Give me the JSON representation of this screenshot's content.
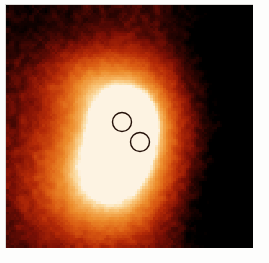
{
  "figure": {
    "title": "",
    "kind": "false-colour intensity map",
    "border_color": "#fcfcfb",
    "plate": {
      "x": 6,
      "y": 5,
      "width": 247,
      "height": 243
    }
  },
  "chart_data": {
    "type": "heatmap",
    "title": "",
    "subtitle": "",
    "xlabel": "",
    "ylabel": "",
    "grid": false,
    "legend": "none",
    "colorbar_shown": false,
    "colormap_name": "heat",
    "colormap_stops": [
      {
        "position": 0.0,
        "color": "#000000",
        "label": "lowest"
      },
      {
        "position": 0.18,
        "color": "#3a0603",
        "label": "very low"
      },
      {
        "position": 0.34,
        "color": "#7e1005",
        "label": "low"
      },
      {
        "position": 0.5,
        "color": "#b52a07",
        "label": "mid-low"
      },
      {
        "position": 0.66,
        "color": "#da5a12",
        "label": "mid"
      },
      {
        "position": 0.8,
        "color": "#ec8a2a",
        "label": "mid-high"
      },
      {
        "position": 0.9,
        "color": "#f6b661",
        "label": "high"
      },
      {
        "position": 0.97,
        "color": "#fbdfaa",
        "label": "very high"
      },
      {
        "position": 1.0,
        "color": "#fdf3e2",
        "label": "peak"
      }
    ],
    "value_range": [
      0,
      1
    ],
    "nx": 96,
    "ny": 94,
    "noise_amplitude": 0.17,
    "background_level": 0.06,
    "sources": [
      {
        "name": "extended halo",
        "cx": 0.475,
        "cy": 0.545,
        "amplitude": 0.62,
        "sigma_x": 0.3,
        "sigma_y": 0.4,
        "rotation_deg": -8
      },
      {
        "name": "inner envelope",
        "cx": 0.485,
        "cy": 0.525,
        "amplitude": 0.55,
        "sigma_x": 0.155,
        "sigma_y": 0.215,
        "rotation_deg": -6
      },
      {
        "name": "bright core",
        "cx": 0.505,
        "cy": 0.5,
        "amplitude": 0.52,
        "sigma_x": 0.062,
        "sigma_y": 0.08,
        "rotation_deg": -12
      },
      {
        "name": "core peak",
        "cx": 0.512,
        "cy": 0.497,
        "amplitude": 0.4,
        "sigma_x": 0.03,
        "sigma_y": 0.036,
        "rotation_deg": 0
      },
      {
        "name": "north-west arc",
        "cx": 0.3,
        "cy": 0.3,
        "amplitude": 0.16,
        "sigma_x": 0.115,
        "sigma_y": 0.105,
        "rotation_deg": 0
      },
      {
        "name": "south-west shelf",
        "cx": 0.265,
        "cy": 0.76,
        "amplitude": 0.2,
        "sigma_x": 0.19,
        "sigma_y": 0.15,
        "rotation_deg": 0
      },
      {
        "name": "south extension",
        "cx": 0.47,
        "cy": 0.8,
        "amplitude": 0.16,
        "sigma_x": 0.175,
        "sigma_y": 0.14,
        "rotation_deg": 0
      }
    ],
    "suppressors": [
      {
        "name": "north-east void",
        "cx": 0.86,
        "cy": 0.185,
        "amplitude": 0.3,
        "sigma_x": 0.2,
        "sigma_y": 0.21
      },
      {
        "name": "south-east void",
        "cx": 0.88,
        "cy": 0.84,
        "amplitude": 0.34,
        "sigma_x": 0.2,
        "sigma_y": 0.215
      },
      {
        "name": "east rim void",
        "cx": 0.925,
        "cy": 0.52,
        "amplitude": 0.22,
        "sigma_x": 0.13,
        "sigma_y": 0.3
      },
      {
        "name": "north void",
        "cx": 0.33,
        "cy": 0.08,
        "amplitude": 0.18,
        "sigma_x": 0.23,
        "sigma_y": 0.11
      }
    ]
  },
  "annotations": {
    "circles": [
      {
        "id": "circle-1",
        "label": "upper aperture",
        "cx": 116,
        "cy": 117,
        "r": 9.5,
        "stroke": "#241008",
        "stroke_width": 1.4
      },
      {
        "id": "circle-2",
        "label": "lower aperture",
        "cx": 134,
        "cy": 137,
        "r": 9.5,
        "stroke": "#241008",
        "stroke_width": 1.4
      }
    ]
  }
}
